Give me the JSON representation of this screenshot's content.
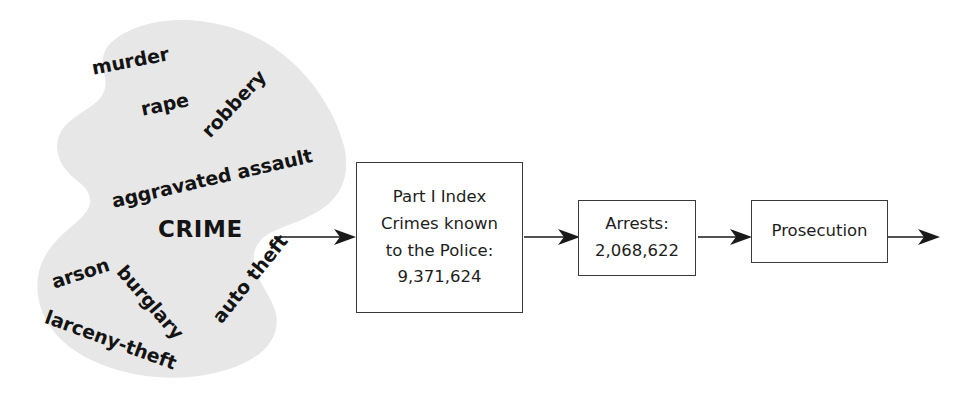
{
  "diagram": {
    "blob": {
      "label": "crime-blob",
      "fill_color": "#e9e9e9",
      "center_label": "CRIME",
      "offense_words": [
        {
          "id": "murder",
          "text": "murder"
        },
        {
          "id": "rape",
          "text": "rape"
        },
        {
          "id": "robbery",
          "text": "robbery"
        },
        {
          "id": "aggravated-assault",
          "text": "aggravated assault"
        },
        {
          "id": "arson",
          "text": "arson"
        },
        {
          "id": "burglary",
          "text": "burglary"
        },
        {
          "id": "larceny-theft",
          "text": "larceny-theft"
        },
        {
          "id": "auto-theft",
          "text": "auto theft"
        }
      ]
    },
    "boxes": [
      {
        "id": "part-i-index-crimes",
        "lines": [
          "Part I Index",
          "Crimes known",
          "to the Police:",
          "9,371,624"
        ],
        "value": "9,371,624"
      },
      {
        "id": "arrests",
        "lines": [
          "Arrests:",
          "2,068,622"
        ],
        "value": "2,068,622"
      },
      {
        "id": "prosecution",
        "lines": [
          "Prosecution"
        ],
        "value": ""
      }
    ],
    "arrows": [
      {
        "id": "arrow-crime-to-index",
        "direction": "right"
      },
      {
        "id": "arrow-index-to-arrests",
        "direction": "right"
      },
      {
        "id": "arrow-arrests-to-prosecution",
        "direction": "right"
      },
      {
        "id": "arrow-prosecution-out",
        "direction": "right"
      }
    ],
    "colors": {
      "blob_fill": "#e9e9e9",
      "box_border": "#3a3a3a",
      "text": "#1d1d1d",
      "arrow": "#1a1a1a",
      "background": "#ffffff"
    }
  }
}
